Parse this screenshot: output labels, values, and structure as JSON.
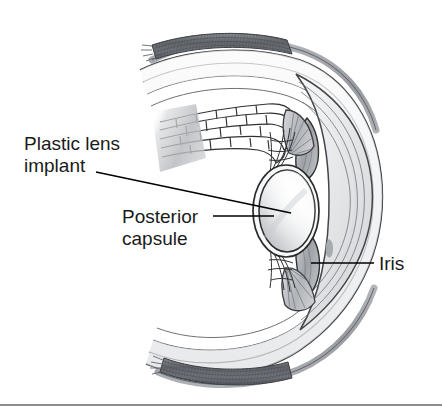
{
  "figure": {
    "background_color": "#ffffff",
    "width": 442,
    "height": 411,
    "bottom_rule": {
      "color": "#8e8e8e",
      "y": 404
    }
  },
  "labels": {
    "plastic_lens": {
      "line1": "Plastic lens",
      "line2": "implant",
      "color": "#1a1a1a"
    },
    "posterior_capsule": {
      "line1": "Posterior",
      "line2": "capsule",
      "color": "#1a1a1a"
    },
    "iris": {
      "line1": "Iris",
      "color": "#1a1a1a"
    }
  },
  "anatomy": {
    "lens_implant": {
      "name": "Plastic lens implant",
      "fill_light": "#fdfdfd",
      "fill_shadow": "#b9bcc0",
      "outline": "#2a2a2a"
    },
    "posterior_capsule": {
      "name": "Posterior capsule",
      "outline": "#2a2a2a"
    },
    "iris": {
      "name": "Iris",
      "fill": "#a8abb0",
      "outline": "#2a2a2a"
    },
    "cornea": {
      "name": "Cornea",
      "fill": "#e9eaec",
      "outline": "#3a3a3a"
    },
    "sclera": {
      "name": "Sclera",
      "fill": "#f0f1f2",
      "outline": "#3a3a3a"
    },
    "choroid": {
      "name": "Choroid",
      "fill": "#9b9ea3",
      "outline": "#4a4a4a"
    },
    "rectus_muscle": {
      "name": "Rectus muscle",
      "fill": "#6e7176",
      "outline": "#3d3f43"
    },
    "ciliary_body": {
      "name": "Ciliary body",
      "fill": "#c3c6ca",
      "outline": "#3a3a3a"
    },
    "zonule_fibers": {
      "name": "Zonule fibers",
      "stroke": "#2f2f2f"
    },
    "retina_layers": {
      "name": "Retina layers cutaway",
      "stroke": "#2f2f2f"
    }
  }
}
